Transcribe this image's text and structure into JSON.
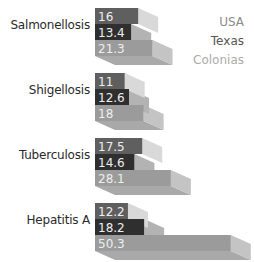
{
  "chart_data": {
    "type": "bar",
    "orientation": "horizontal",
    "style": "3d-stacked-offset",
    "title": "",
    "xlabel": "",
    "ylabel": "",
    "categories": [
      "Salmonellosis",
      "Shigellosis",
      "Tuberculosis",
      "Hepatitis A"
    ],
    "series": [
      {
        "name": "USA",
        "values": [
          16,
          11,
          17.5,
          12.2
        ],
        "color": "#5f5f5f",
        "side_color": "#d9d9d9"
      },
      {
        "name": "Texas",
        "values": [
          13.4,
          12.6,
          14.6,
          18.2
        ],
        "color": "#2f2f2f",
        "side_color": "#b3b3b3"
      },
      {
        "name": "Colonias",
        "values": [
          21.3,
          18,
          28.1,
          50.3
        ],
        "color": "#9b9b9b",
        "side_color": "#c4c4c4"
      }
    ],
    "legend": {
      "position": "top-right",
      "entries": [
        "USA",
        "Texas",
        "Colonias"
      ]
    },
    "grid": false,
    "data_labels": true
  },
  "legend": {
    "items": [
      {
        "label": "USA",
        "color": "#8a8a8a"
      },
      {
        "label": "Texas",
        "color": "#555555"
      },
      {
        "label": "Colonias",
        "color": "#ababab"
      }
    ]
  }
}
